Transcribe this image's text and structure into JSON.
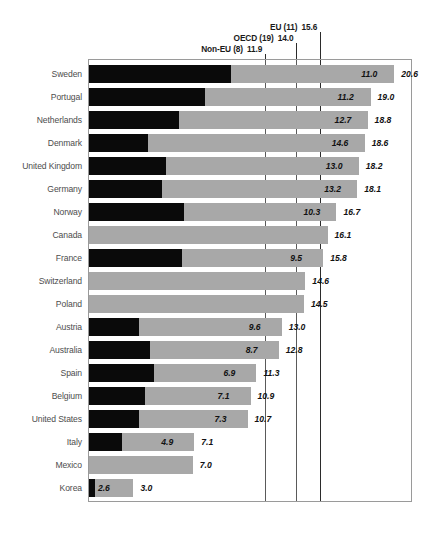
{
  "chart_data": {
    "type": "bar",
    "title": "",
    "subtitle": "",
    "xlabel": "",
    "ylabel": "",
    "orientation": "horizontal",
    "stacked": true,
    "grid": false,
    "legend_position": "none",
    "xlim": [
      0,
      21.8
    ],
    "categories": [
      "Sweden",
      "Portugal",
      "Netherlands",
      "Denmark",
      "United Kingdom",
      "Germany",
      "Norway",
      "Canada",
      "France",
      "Switzerland",
      "Poland",
      "Austria",
      "Australia",
      "Spain",
      "Belgium",
      "United States",
      "Italy",
      "Mexico",
      "Korea"
    ],
    "series": [
      {
        "name": "total",
        "values": [
          20.6,
          19.0,
          18.8,
          18.6,
          18.2,
          18.1,
          16.7,
          16.1,
          15.8,
          14.6,
          14.5,
          13.0,
          12.8,
          11.3,
          10.9,
          10.7,
          7.1,
          7.0,
          3.0
        ]
      },
      {
        "name": "inner",
        "values": [
          11.0,
          11.2,
          12.7,
          14.6,
          13.0,
          13.2,
          10.3,
          null,
          9.5,
          null,
          null,
          9.6,
          8.7,
          6.9,
          7.1,
          7.3,
          4.9,
          null,
          2.6
        ]
      }
    ],
    "value_labels": {
      "total": [
        "20.6",
        "19.0",
        "18.8",
        "18.6",
        "18.2",
        "18.1",
        "16.7",
        "16.1",
        "15.8",
        "14.6",
        "14.5",
        "13.0",
        "12.8",
        "11.3",
        "10.9",
        "10.7",
        "7.1",
        "7.0",
        "3.0"
      ],
      "inner": [
        "11.0",
        "11.2",
        "12.7",
        "14.6",
        "13.0",
        "13.2",
        "10.3",
        "",
        "9.5",
        "",
        "",
        "9.6",
        "8.7",
        "6.9",
        "7.1",
        "7.3",
        "4.9",
        "",
        "2.6"
      ]
    },
    "reference_lines": [
      {
        "label": "Non-EU (8)",
        "value": 11.9,
        "value_label": "11.9"
      },
      {
        "label": "OECD (19)",
        "value": 14.0,
        "value_label": "14.0"
      },
      {
        "label": "EU (11)",
        "value": 15.6,
        "value_label": "15.6"
      }
    ],
    "colors": {
      "total_bar": "#a8a8a8",
      "inner_bar": "#0a0a0a",
      "reference_line": "#2b2b2b",
      "frame": "#9a9a9a",
      "label_text": "#4d4d4d",
      "value_text": "#111111"
    }
  }
}
